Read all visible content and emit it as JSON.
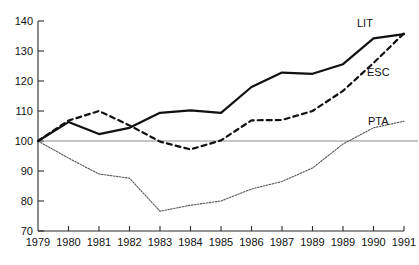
{
  "chart_data": {
    "type": "line",
    "title": "",
    "subtitle": "",
    "xlabel": "",
    "ylabel": "",
    "xlim": [
      1979,
      1991
    ],
    "ylim": [
      70,
      140
    ],
    "yticks": [
      70,
      80,
      90,
      100,
      110,
      120,
      130,
      140
    ],
    "grid": false,
    "baseline": 100,
    "legend_position": "inline-right",
    "x": [
      1979,
      1980,
      1981,
      1982,
      1983,
      1984,
      1985,
      1986,
      1987,
      1989,
      1989,
      1990,
      1991
    ],
    "categories": [
      "1979",
      "1980",
      "1981",
      "1982",
      "1983",
      "1984",
      "1985",
      "1986",
      "1987",
      "1989",
      "1989",
      "1990",
      "1991"
    ],
    "series": [
      {
        "name": "LIT",
        "style": "solid",
        "color": "#111111",
        "values": [
          100.0,
          106.3,
          102.3,
          104.4,
          109.4,
          110.2,
          109.4,
          118.0,
          122.8,
          122.4,
          125.6,
          134.2,
          135.6
        ]
      },
      {
        "name": "ESC",
        "style": "dashed",
        "color": "#111111",
        "values": [
          100.0,
          106.8,
          110.0,
          105.2,
          99.8,
          97.2,
          100.2,
          106.9,
          107.0,
          110.0,
          116.7,
          126.0,
          135.9
        ]
      },
      {
        "name": "PTA",
        "style": "dotted",
        "color": "#555555",
        "values": [
          100.0,
          94.3,
          89.0,
          87.6,
          76.6,
          78.6,
          80.0,
          84.0,
          86.5,
          91.0,
          99.0,
          104.4,
          106.6
        ]
      }
    ]
  },
  "axes": {
    "y_tick_labels": [
      "140",
      "130",
      "120",
      "110",
      "100",
      "90",
      "80",
      "70"
    ],
    "x_tick_labels": [
      "1979",
      "1980",
      "1981",
      "1982",
      "1983",
      "1984",
      "1985",
      "1986",
      "1987",
      "1989",
      "1989",
      "1990",
      "1991"
    ]
  },
  "labels": {
    "lit": "LIT",
    "esc": "ESC",
    "pta": "PTA"
  }
}
